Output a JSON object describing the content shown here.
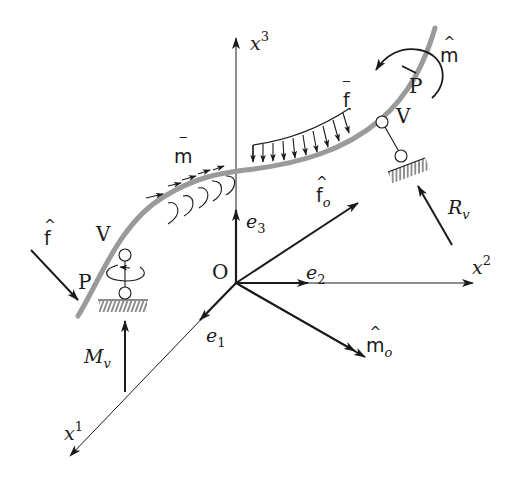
{
  "figure": {
    "colors": {
      "rod": "#9a9a9a",
      "ink": "#1a1a1a",
      "background": "#ffffff"
    }
  },
  "axes": {
    "origin": {
      "label": "O",
      "x": 236,
      "y": 283
    },
    "x1": {
      "base": "x",
      "sup": "1"
    },
    "x2": {
      "base": "x",
      "sup": "2"
    },
    "x3": {
      "base": "x",
      "sup": "3"
    },
    "e1": {
      "base": "e",
      "sub": "1"
    },
    "e2": {
      "base": "e",
      "sub": "2"
    },
    "e3": {
      "base": "e",
      "sub": "3"
    }
  },
  "resultants": {
    "f_o": {
      "base": "f",
      "accent": "^",
      "sub": "o"
    },
    "m_o": {
      "base": "m",
      "accent": "^",
      "sub": "o"
    }
  },
  "distributed_loads": {
    "force": {
      "base": "f",
      "accent": "‾",
      "arrow_count": 10
    },
    "moment": {
      "base": "m",
      "accent": "‾",
      "arrow_count": 5
    }
  },
  "left_end": {
    "point_label": "P",
    "support_label": "V",
    "applied_force": {
      "base": "f",
      "accent": "^"
    },
    "reaction_moment": {
      "base": "M",
      "sub": "v"
    }
  },
  "right_end": {
    "point_label": "P",
    "support_label": "V",
    "applied_moment": {
      "base": "m",
      "accent": "^"
    },
    "reaction_force": {
      "base": "R",
      "sub": "v"
    }
  }
}
